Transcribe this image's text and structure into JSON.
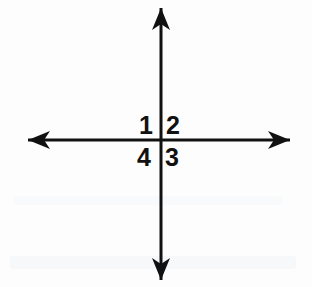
{
  "figure": {
    "background_color": "#fdfdfd",
    "stroke_color": "#111111",
    "width": 312,
    "height": 287
  },
  "axes": {
    "origin": {
      "x": 161,
      "y": 140
    },
    "horizontal": {
      "name": "horizontal-axis",
      "x_start": 28,
      "x_end": 290,
      "y": 140,
      "stroke_width": 3,
      "arrow_start": true,
      "arrow_end": true
    },
    "vertical": {
      "name": "vertical-axis",
      "x": 161,
      "y_start": 8,
      "y_end": 280,
      "stroke_width": 3,
      "arrow_start": true,
      "arrow_end": true
    }
  },
  "arrowheads": {
    "style": "swept-back-concave",
    "length": 22,
    "half_width": 9,
    "notch": 6,
    "items": [
      {
        "name": "arrowhead-up",
        "direction": "up",
        "tip_x": 161,
        "tip_y": 8
      },
      {
        "name": "arrowhead-down",
        "direction": "down",
        "tip_x": 161,
        "tip_y": 280
      },
      {
        "name": "arrowhead-left",
        "direction": "left",
        "tip_x": 28,
        "tip_y": 140
      },
      {
        "name": "arrowhead-right",
        "direction": "right",
        "tip_x": 290,
        "tip_y": 140
      }
    ]
  },
  "quadrant_labels": [
    {
      "name": "quadrant-label-1",
      "text": "1",
      "quadrant": "upper-left"
    },
    {
      "name": "quadrant-label-2",
      "text": "2",
      "quadrant": "upper-right"
    },
    {
      "name": "quadrant-label-3",
      "text": "3",
      "quadrant": "lower-right"
    },
    {
      "name": "quadrant-label-4",
      "text": "4",
      "quadrant": "lower-left"
    }
  ]
}
